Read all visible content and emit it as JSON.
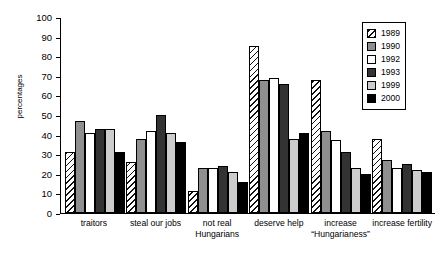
{
  "chart_data": {
    "type": "bar",
    "title": "",
    "subtitle": "",
    "xlabel": "",
    "ylabel": "percentages",
    "ylim": [
      0,
      100
    ],
    "yticks": [
      0,
      10,
      20,
      30,
      40,
      50,
      60,
      70,
      80,
      90,
      100
    ],
    "grid": false,
    "legend_position": "top-right",
    "categories": [
      "traitors",
      "steal our jobs",
      "not real\nHungarians",
      "deserve help",
      "increase\n“Hungarianess”",
      "increase fertility"
    ],
    "category_lines": [
      [
        "traitors"
      ],
      [
        "steal our jobs"
      ],
      [
        "not real",
        "Hungarians"
      ],
      [
        "deserve help"
      ],
      [
        "increase",
        "“Hungarianess”"
      ],
      [
        "increase fertility"
      ]
    ],
    "series": [
      {
        "name": "1989",
        "fill": "hatch-diagonal",
        "color": "#ffffff",
        "values": [
          31,
          26,
          11,
          85,
          68,
          38
        ]
      },
      {
        "name": "1990",
        "fill": "solid",
        "color": "#8f8f8f",
        "values": [
          47,
          38,
          23,
          68,
          42,
          27
        ]
      },
      {
        "name": "1992",
        "fill": "solid",
        "color": "#ffffff",
        "values": [
          41,
          42,
          23,
          69,
          37,
          23
        ]
      },
      {
        "name": "1993",
        "fill": "solid",
        "color": "#333333",
        "values": [
          43,
          50,
          24,
          66,
          31,
          25
        ]
      },
      {
        "name": "1999",
        "fill": "solid",
        "color": "#cccccc",
        "values": [
          43,
          41,
          21,
          38,
          23,
          22
        ]
      },
      {
        "name": "2000",
        "fill": "solid",
        "color": "#000000",
        "values": [
          31,
          36,
          16,
          41,
          20,
          21
        ]
      }
    ]
  },
  "legend": {
    "entries": [
      {
        "label": "1989"
      },
      {
        "label": "1990"
      },
      {
        "label": "1992"
      },
      {
        "label": "1993"
      },
      {
        "label": "1999"
      },
      {
        "label": "2000"
      }
    ]
  }
}
